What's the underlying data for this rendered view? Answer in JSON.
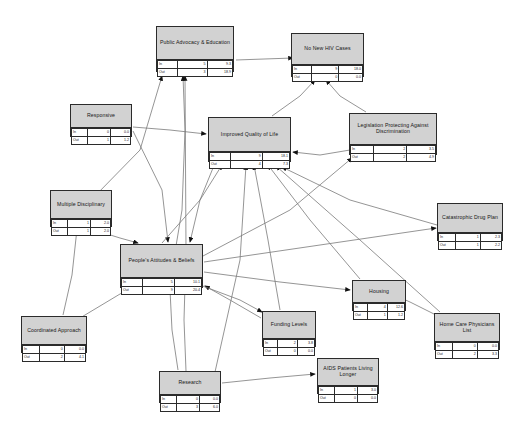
{
  "diagram": {
    "row_labels": {
      "in": "In",
      "out": "Out"
    },
    "node_bg": "#d2d2d2",
    "edge_color": "#7a7a7a",
    "border_color": "#2b2b2b"
  },
  "nodes": [
    {
      "id": "public-advocacy-education",
      "label": "Public Advocacy & Education",
      "x": 156,
      "y": 26,
      "w": 78,
      "h": 46,
      "title_h": 26,
      "rows": [
        {
          "label": "In",
          "mid": "5",
          "val": "9.3"
        },
        {
          "label": "Out",
          "mid": "3",
          "val": "18.9"
        }
      ]
    },
    {
      "id": "no-new-hiv-cases",
      "label": "No New HIV Cases",
      "x": 291,
      "y": 33,
      "w": 73,
      "h": 44,
      "title_h": 24,
      "rows": [
        {
          "label": "In",
          "mid": "9",
          "val": "18.0"
        },
        {
          "label": "Out",
          "mid": "0",
          "val": "0.0"
        }
      ]
    },
    {
      "id": "responsive",
      "label": "Responsive",
      "x": 70,
      "y": 104,
      "w": 62,
      "h": 33,
      "title_h": 16,
      "rows": [
        {
          "label": "In",
          "mid": "0",
          "val": "0.0"
        },
        {
          "label": "Out",
          "mid": "1",
          "val": "1.2"
        }
      ]
    },
    {
      "id": "improved-quality-of-life",
      "label": "Improved Quality of Life",
      "x": 208,
      "y": 117,
      "w": 83,
      "h": 45,
      "title_h": 27,
      "rows": [
        {
          "label": "In",
          "mid": "9",
          "val": "18.1"
        },
        {
          "label": "Out",
          "mid": "4",
          "val": "7.3"
        }
      ]
    },
    {
      "id": "legislation-protecting-against-discrimination",
      "label": "Legislation Protecting Against Discrimination",
      "x": 349,
      "y": 113,
      "w": 88,
      "h": 42,
      "title_h": 24,
      "rows": [
        {
          "label": "In",
          "mid": "2",
          "val": "3.5"
        },
        {
          "label": "Out",
          "mid": "2",
          "val": "4.9"
        }
      ]
    },
    {
      "id": "multiple-disciplinary",
      "label": "Multiple Disciplinary",
      "x": 50,
      "y": 190,
      "w": 62,
      "h": 37,
      "title_h": 21,
      "rows": [
        {
          "label": "In",
          "mid": "1",
          "val": "2.0"
        },
        {
          "label": "Out",
          "mid": "1",
          "val": "2.0"
        }
      ]
    },
    {
      "id": "catastrophic-drug-plan",
      "label": "Catastrophic Drug Plan",
      "x": 437,
      "y": 203,
      "w": 66,
      "h": 38,
      "title_h": 22,
      "rows": [
        {
          "label": "In",
          "mid": "1",
          "val": "2.3"
        },
        {
          "label": "Out",
          "mid": "1",
          "val": "2.2"
        }
      ]
    },
    {
      "id": "peoples-attitudes-beliefs",
      "label": "People's Attitudes & Beliefs",
      "x": 120,
      "y": 244,
      "w": 83,
      "h": 44,
      "title_h": 26,
      "rows": [
        {
          "label": "In",
          "mid": "5",
          "val": "10.1"
        },
        {
          "label": "Out",
          "mid": "9",
          "val": "20.4"
        }
      ]
    },
    {
      "id": "housing",
      "label": "Housing",
      "x": 352,
      "y": 280,
      "w": 54,
      "h": 31,
      "title_h": 15,
      "rows": [
        {
          "label": "In",
          "mid": "4",
          "val": "12.6"
        },
        {
          "label": "Out",
          "mid": "1",
          "val": "1.2"
        }
      ]
    },
    {
      "id": "funding-levels",
      "label": "Funding Levels",
      "x": 262,
      "y": 311,
      "w": 54,
      "h": 36,
      "title_h": 20,
      "rows": [
        {
          "label": "In",
          "mid": "2",
          "val": "3.8"
        },
        {
          "label": "Out",
          "mid": "0",
          "val": "0.0"
        }
      ]
    },
    {
      "id": "coordinated-approach",
      "label": "Coordinated Approach",
      "x": 21,
      "y": 316,
      "w": 66,
      "h": 37,
      "title_h": 21,
      "rows": [
        {
          "label": "In",
          "mid": "0",
          "val": "0.0"
        },
        {
          "label": "Out",
          "mid": "2",
          "val": "4.1"
        }
      ]
    },
    {
      "id": "home-care-physicians-list",
      "label": "Home Care Physicians List",
      "x": 434,
      "y": 313,
      "w": 66,
      "h": 37,
      "title_h": 21,
      "rows": [
        {
          "label": "In",
          "mid": "0",
          "val": "0.0"
        },
        {
          "label": "Out",
          "mid": "2",
          "val": "3.3"
        }
      ]
    },
    {
      "id": "research",
      "label": "Research",
      "x": 159,
      "y": 371,
      "w": 62,
      "h": 32,
      "title_h": 16,
      "rows": [
        {
          "label": "In",
          "mid": "0",
          "val": "0.0"
        },
        {
          "label": "Out",
          "mid": "3",
          "val": "6.0"
        }
      ]
    },
    {
      "id": "aids-patients-living-longer",
      "label": "AIDS Patients Living Longer",
      "x": 317,
      "y": 358,
      "w": 62,
      "h": 36,
      "title_h": 20,
      "rows": [
        {
          "label": "In",
          "mid": "1",
          "val": "3.0"
        },
        {
          "label": "Out",
          "mid": "0",
          "val": "0.0"
        }
      ]
    }
  ],
  "edges": [
    {
      "from": "public-advocacy-education",
      "to": "no-new-hiv-cases",
      "points": "236,60 293,58"
    },
    {
      "from": "peoples-attitudes-beliefs",
      "to": "public-advocacy-education",
      "points": "176,246 182,210 185,130 183,76"
    },
    {
      "from": "research",
      "to": "public-advocacy-education",
      "points": "186,371 184,320 186,250 185,76"
    },
    {
      "from": "responsive",
      "to": "improved-quality-of-life",
      "points": "133,127 170,130 206,134"
    },
    {
      "from": "responsive",
      "to": "peoples-attitudes-beliefs",
      "points": "133,131 162,190 168,242"
    },
    {
      "from": "legislation-protecting-against-discrimination",
      "to": "no-new-hiv-cases",
      "points": "366,112 340,96 326,80"
    },
    {
      "from": "improved-quality-of-life",
      "to": "no-new-hiv-cases",
      "points": "272,116 300,96 315,80"
    },
    {
      "from": "improved-quality-of-life",
      "to": "peoples-attitudes-beliefs",
      "points": "215,163 200,200 190,242"
    },
    {
      "from": "peoples-attitudes-beliefs",
      "to": "improved-quality-of-life",
      "points": "162,243 200,200 222,165"
    },
    {
      "from": "peoples-attitudes-beliefs",
      "to": "legislation-protecting-against-discrimination",
      "points": "203,256 290,210 352,158"
    },
    {
      "from": "peoples-attitudes-beliefs",
      "to": "catastrophic-drug-plan",
      "points": "204,262 320,245 436,228"
    },
    {
      "from": "peoples-attitudes-beliefs",
      "to": "housing",
      "points": "204,272 280,282 350,290"
    },
    {
      "from": "funding-levels",
      "to": "improved-quality-of-life",
      "points": "280,310 268,240 254,165"
    },
    {
      "from": "funding-levels",
      "to": "peoples-attitudes-beliefs",
      "points": "261,318 230,300 205,286"
    },
    {
      "from": "housing",
      "to": "improved-quality-of-life",
      "points": "360,279 310,220 268,165"
    },
    {
      "from": "catastrophic-drug-plan",
      "to": "improved-quality-of-life",
      "points": "437,225 350,200 282,167"
    },
    {
      "from": "home-care-physicians-list",
      "to": "housing",
      "points": "436,315 410,302 392,294"
    },
    {
      "from": "home-care-physicians-list",
      "to": "improved-quality-of-life",
      "points": "440,312 360,240 276,166"
    },
    {
      "from": "research",
      "to": "peoples-attitudes-beliefs",
      "points": "178,370 172,330 170,290"
    },
    {
      "from": "research",
      "to": "aids-patients-living-longer",
      "points": "222,383 270,378 315,374"
    },
    {
      "from": "research",
      "to": "improved-quality-of-life",
      "points": "215,372 240,260 246,165"
    },
    {
      "from": "coordinated-approach",
      "to": "multiple-disciplinary",
      "points": "63,315 72,275 77,229"
    },
    {
      "from": "coordinated-approach",
      "to": "peoples-attitudes-beliefs",
      "points": "80,318 110,300 130,288"
    },
    {
      "from": "multiple-disciplinary",
      "to": "peoples-attitudes-beliefs",
      "points": "88,228 120,238 138,243"
    },
    {
      "from": "multiple-disciplinary",
      "to": "public-advocacy-education",
      "points": "95,196 140,150 162,76"
    },
    {
      "from": "legislation-protecting-against-discrimination",
      "to": "improved-quality-of-life",
      "points": "350,150 320,155 293,152"
    },
    {
      "from": "peoples-attitudes-beliefs",
      "to": "funding-levels",
      "points": "200,285 240,300 262,312"
    }
  ]
}
